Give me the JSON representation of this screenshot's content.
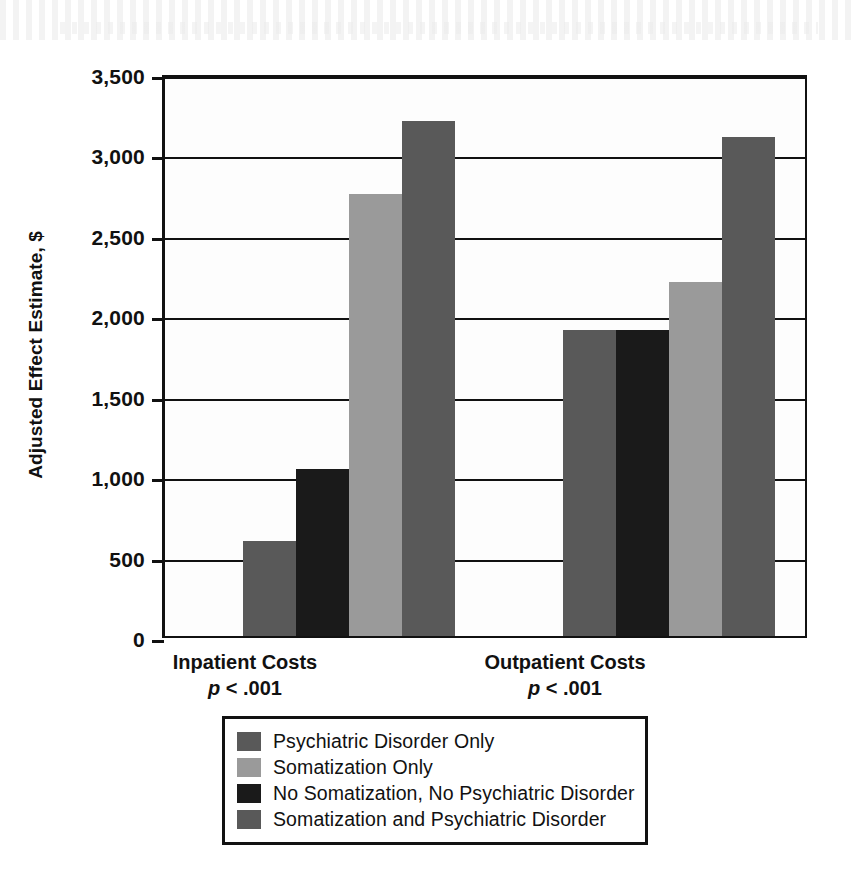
{
  "chart_data": {
    "type": "bar",
    "title": "",
    "subtitle": "",
    "xlabel": "",
    "ylabel": "Adjusted Effect Estimate, $",
    "ylim": [
      0,
      3500
    ],
    "yticks": [
      0,
      500,
      1000,
      1500,
      2000,
      2500,
      3000,
      3500
    ],
    "ytick_labels": [
      "0",
      "500",
      "1,000",
      "1,500",
      "2,000",
      "2,500",
      "3,000",
      "3,500"
    ],
    "grid": true,
    "legend_position": "bottom",
    "categories": [
      "Inpatient Costs",
      "Outpatient Costs"
    ],
    "category_annotations": [
      "p < .001",
      "p < .001"
    ],
    "bar_order_in_group": [
      "Psychiatric Disorder Only",
      "No Somatization, No Psychiatric Disorder",
      "Somatization Only",
      "Somatization and Psychiatric Disorder"
    ],
    "series": [
      {
        "name": "Psychiatric Disorder Only",
        "color": "#595959",
        "values": [
          590,
          1900
        ]
      },
      {
        "name": "No Somatization, No Psychiatric Disorder",
        "color": "#1a1a1a",
        "values": [
          1040,
          1900
        ]
      },
      {
        "name": "Somatization Only",
        "color": "#9a9a9a",
        "values": [
          2750,
          2200
        ]
      },
      {
        "name": "Somatization and Psychiatric Disorder",
        "color": "#595959",
        "values": [
          3200,
          3100
        ]
      }
    ]
  },
  "axis": {
    "y_title": "Adjusted Effect Estimate, $",
    "ticks": [
      {
        "value": 3500,
        "label": "3,500"
      },
      {
        "value": 3000,
        "label": "3,000"
      },
      {
        "value": 2500,
        "label": "2,500"
      },
      {
        "value": 2000,
        "label": "2,000"
      },
      {
        "value": 1500,
        "label": "1,500"
      },
      {
        "value": 1000,
        "label": "1,000"
      },
      {
        "value": 500,
        "label": "500"
      },
      {
        "value": 0,
        "label": "0"
      }
    ]
  },
  "groups": [
    {
      "label": "Inpatient Costs",
      "pvalue_prefix": "p",
      "pvalue_rest": " < .001"
    },
    {
      "label": "Outpatient Costs",
      "pvalue_prefix": "p",
      "pvalue_rest": " < .001"
    }
  ],
  "legend": {
    "items": [
      {
        "label": "Psychiatric Disorder Only",
        "color": "#595959"
      },
      {
        "label": "Somatization Only",
        "color": "#9a9a9a"
      },
      {
        "label": "No Somatization, No Psychiatric Disorder",
        "color": "#1a1a1a"
      },
      {
        "label": "Somatization and Psychiatric Disorder",
        "color": "#595959"
      }
    ]
  },
  "colors": {
    "dark_gray": "#595959",
    "light_gray": "#9a9a9a",
    "black": "#1a1a1a",
    "axis": "#111111",
    "background": "#ffffff"
  }
}
